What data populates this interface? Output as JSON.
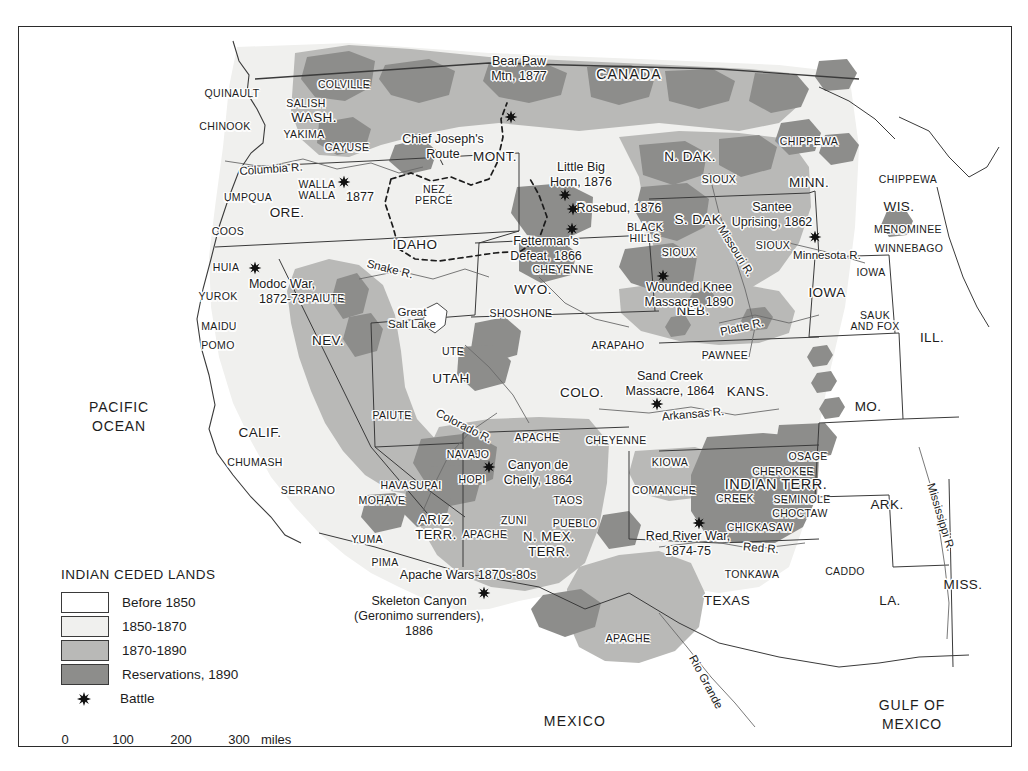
{
  "map": {
    "title_fragment": "",
    "countries": [
      {
        "name": "CANADA",
        "x": 610,
        "y": 48
      },
      {
        "name": "MEXICO",
        "x": 556,
        "y": 695
      }
    ],
    "oceans": [
      {
        "name": "PACIFIC\nOCEAN",
        "x": 100,
        "y": 390
      },
      {
        "name": "GULF OF\nMEXICO",
        "x": 893,
        "y": 688
      }
    ],
    "states": [
      {
        "name": "WASH.",
        "x": 295,
        "y": 91,
        "size": "lg"
      },
      {
        "name": "ORE.",
        "x": 268,
        "y": 186,
        "size": "lg"
      },
      {
        "name": "IDAHO",
        "x": 396,
        "y": 218,
        "size": "lg"
      },
      {
        "name": "MONT.",
        "x": 476,
        "y": 130,
        "size": "lg"
      },
      {
        "name": "N. DAK.",
        "x": 671,
        "y": 130,
        "size": "lg"
      },
      {
        "name": "S. DAK.",
        "x": 681,
        "y": 193,
        "size": "lg"
      },
      {
        "name": "MINN.",
        "x": 790,
        "y": 156,
        "size": "lg"
      },
      {
        "name": "WIS.",
        "x": 880,
        "y": 180,
        "size": "lg"
      },
      {
        "name": "IOWA",
        "x": 808,
        "y": 266,
        "size": "lg"
      },
      {
        "name": "ILL.",
        "x": 913,
        "y": 311,
        "size": "lg"
      },
      {
        "name": "MO.",
        "x": 849,
        "y": 380,
        "size": "lg"
      },
      {
        "name": "NEB.",
        "x": 674,
        "y": 284,
        "size": "lg"
      },
      {
        "name": "WYO.",
        "x": 514,
        "y": 263,
        "size": "lg"
      },
      {
        "name": "NEV.",
        "x": 309,
        "y": 314,
        "size": "lg"
      },
      {
        "name": "UTAH",
        "x": 432,
        "y": 352,
        "size": "lg"
      },
      {
        "name": "COLO.",
        "x": 563,
        "y": 366,
        "size": "lg"
      },
      {
        "name": "KANS.",
        "x": 729,
        "y": 365,
        "size": "lg"
      },
      {
        "name": "CALIF.",
        "x": 241,
        "y": 406,
        "size": "lg"
      },
      {
        "name": "ARK.",
        "x": 868,
        "y": 478,
        "size": "lg"
      },
      {
        "name": "MISS.",
        "x": 944,
        "y": 558,
        "size": "lg"
      },
      {
        "name": "LA.",
        "x": 871,
        "y": 574,
        "size": "lg"
      },
      {
        "name": "TEXAS",
        "x": 708,
        "y": 574,
        "size": "lg"
      }
    ],
    "territories": [
      {
        "name": "ARIZ.\nTERR.",
        "x": 417,
        "y": 501
      },
      {
        "name": "N. MEX.\nTERR.",
        "x": 530,
        "y": 518
      },
      {
        "name": "INDIAN TERR.",
        "x": 757,
        "y": 458
      }
    ],
    "tribes": [
      {
        "name": "QUINAULT",
        "x": 213,
        "y": 67
      },
      {
        "name": "CHINOOK",
        "x": 206,
        "y": 100
      },
      {
        "name": "SALISH",
        "x": 287,
        "y": 77
      },
      {
        "name": "YAKIMA",
        "x": 285,
        "y": 108
      },
      {
        "name": "COLVILLE",
        "x": 325,
        "y": 58
      },
      {
        "name": "CAYUSE",
        "x": 328,
        "y": 121
      },
      {
        "name": "WALLA\nWALLA",
        "x": 298,
        "y": 163
      },
      {
        "name": "UMPQUA",
        "x": 229,
        "y": 171
      },
      {
        "name": "COOS",
        "x": 209,
        "y": 205
      },
      {
        "name": "HUIA",
        "x": 207,
        "y": 241
      },
      {
        "name": "YUROK",
        "x": 199,
        "y": 270
      },
      {
        "name": "MAIDU",
        "x": 200,
        "y": 300
      },
      {
        "name": "POMO",
        "x": 199,
        "y": 319
      },
      {
        "name": "CHUMASH",
        "x": 236,
        "y": 436
      },
      {
        "name": "SERRANO",
        "x": 289,
        "y": 464
      },
      {
        "name": "NEZ\nPERCÉ",
        "x": 415,
        "y": 168
      },
      {
        "name": "PAIUTE",
        "x": 306,
        "y": 272
      },
      {
        "name": "PAIUTE",
        "x": 373,
        "y": 389
      },
      {
        "name": "SHOSHONE",
        "x": 502,
        "y": 287
      },
      {
        "name": "UTE",
        "x": 434,
        "y": 325
      },
      {
        "name": "SIOUX",
        "x": 700,
        "y": 153
      },
      {
        "name": "SIOUX",
        "x": 660,
        "y": 226
      },
      {
        "name": "SIOUX",
        "x": 754,
        "y": 219
      },
      {
        "name": "BLACK\nHILLS",
        "x": 626,
        "y": 206
      },
      {
        "name": "CHEYENNE",
        "x": 544,
        "y": 243
      },
      {
        "name": "CHEYENNE",
        "x": 597,
        "y": 414
      },
      {
        "name": "ARAPAHO",
        "x": 599,
        "y": 319
      },
      {
        "name": "PAWNEE",
        "x": 706,
        "y": 329
      },
      {
        "name": "CHIPPEWA",
        "x": 790,
        "y": 115
      },
      {
        "name": "CHIPPEWA",
        "x": 889,
        "y": 153
      },
      {
        "name": "MENOMINEE",
        "x": 889,
        "y": 203
      },
      {
        "name": "WINNEBAGO",
        "x": 890,
        "y": 222
      },
      {
        "name": "IOWA",
        "x": 852,
        "y": 246
      },
      {
        "name": "SAUK\nAND FOX",
        "x": 856,
        "y": 294
      },
      {
        "name": "KIOWA",
        "x": 651,
        "y": 436
      },
      {
        "name": "COMANCHE",
        "x": 645,
        "y": 464
      },
      {
        "name": "OSAGE",
        "x": 789,
        "y": 430
      },
      {
        "name": "CHEROKEE",
        "x": 764,
        "y": 445
      },
      {
        "name": "CREEK",
        "x": 716,
        "y": 472
      },
      {
        "name": "SEMINOLE",
        "x": 783,
        "y": 473
      },
      {
        "name": "CHOCTAW",
        "x": 781,
        "y": 487
      },
      {
        "name": "CHICKASAW",
        "x": 741,
        "y": 501
      },
      {
        "name": "CADDO",
        "x": 826,
        "y": 545
      },
      {
        "name": "TONKAWA",
        "x": 733,
        "y": 548
      },
      {
        "name": "NAVAJO",
        "x": 449,
        "y": 428
      },
      {
        "name": "HOPI",
        "x": 453,
        "y": 453
      },
      {
        "name": "HAVASUPAI",
        "x": 392,
        "y": 459
      },
      {
        "name": "MOHAVE",
        "x": 363,
        "y": 474
      },
      {
        "name": "YUMA",
        "x": 348,
        "y": 513
      },
      {
        "name": "PIMA",
        "x": 366,
        "y": 536
      },
      {
        "name": "APACHE",
        "x": 518,
        "y": 411
      },
      {
        "name": "APACHE",
        "x": 466,
        "y": 508
      },
      {
        "name": "ZUNI",
        "x": 495,
        "y": 494
      },
      {
        "name": "PUEBLO",
        "x": 556,
        "y": 497
      },
      {
        "name": "TAOS",
        "x": 549,
        "y": 474
      },
      {
        "name": "APACHE",
        "x": 609,
        "y": 612
      }
    ],
    "rivers": [
      {
        "name": "Columbia R.",
        "x": 252,
        "y": 142,
        "rot": -4
      },
      {
        "name": "Snake R.",
        "x": 371,
        "y": 242,
        "rot": 14
      },
      {
        "name": "Missouri R.",
        "x": 717,
        "y": 224,
        "rot": 58
      },
      {
        "name": "Minnesota R.",
        "x": 808,
        "y": 228,
        "rot": 0
      },
      {
        "name": "Platte R.",
        "x": 723,
        "y": 300,
        "rot": -13
      },
      {
        "name": "Arkansas R.",
        "x": 674,
        "y": 387,
        "rot": -5
      },
      {
        "name": "Colorado R.",
        "x": 445,
        "y": 399,
        "rot": 27
      },
      {
        "name": "Red R.",
        "x": 742,
        "y": 521,
        "rot": 5
      },
      {
        "name": "Rio Grande",
        "x": 687,
        "y": 655,
        "rot": 62
      },
      {
        "name": "Mississippi R.",
        "x": 922,
        "y": 490,
        "rot": 73
      },
      {
        "name": "Great\nSalt Lake",
        "x": 393,
        "y": 291,
        "rot": 0
      }
    ],
    "routes": [
      {
        "name": "Chief Joseph's\nRoute",
        "x": 424,
        "y": 120
      }
    ],
    "battles": [
      {
        "name": "Bear Paw\nMtn, 1877",
        "lx": 500,
        "ly": 42,
        "sx": 492,
        "sy": 90
      },
      {
        "name": "Little Big\nHorn, 1876",
        "lx": 562,
        "ly": 148,
        "sx": 546,
        "sy": 168
      },
      {
        "name": "Rosebud, 1876",
        "lx": 600,
        "ly": 181,
        "sx": 554,
        "sy": 182
      },
      {
        "name": "Fetterman's\nDefeat, 1866",
        "lx": 527,
        "ly": 222,
        "sx": 553,
        "sy": 202
      },
      {
        "name": "Wounded Knee\nMassacre, 1890",
        "lx": 670,
        "ly": 268,
        "sx": 644,
        "sy": 249
      },
      {
        "name": "Santee\nUprising, 1862",
        "lx": 753,
        "ly": 188,
        "sx": 796,
        "sy": 210
      },
      {
        "name": "Modoc War,\n1872-73",
        "lx": 263,
        "ly": 265,
        "sx": 236,
        "sy": 241
      },
      {
        "name": "Sand Creek\nMassacre, 1864",
        "lx": 651,
        "ly": 357,
        "sx": 638,
        "sy": 377
      },
      {
        "name": "Canyon de\nChelly, 1864",
        "lx": 519,
        "ly": 446,
        "sx": 470,
        "sy": 440
      },
      {
        "name": "Red River War,\n1874-75",
        "lx": 669,
        "ly": 517,
        "sx": 680,
        "sy": 496
      },
      {
        "name": "Apache Wars 1870s-80s",
        "lx": 449,
        "ly": 548,
        "sx": -100,
        "sy": -100
      },
      {
        "name": "Skeleton Canyon\n(Geronimo surrenders),\n1886",
        "lx": 400,
        "ly": 589,
        "sx": 465,
        "sy": 566
      },
      {
        "name": "1877",
        "lx": 341,
        "ly": 170,
        "sx": 325,
        "sy": 155
      }
    ],
    "legend": {
      "title": "INDIAN CEDED LANDS",
      "items": [
        {
          "label": "Before 1850",
          "color": "#ffffff",
          "type": "swatch"
        },
        {
          "label": "1850-1870",
          "color": "#f0f0ee",
          "type": "swatch"
        },
        {
          "label": "1870-1890",
          "color": "#b9b9b7",
          "type": "swatch"
        },
        {
          "label": "Reservations, 1890",
          "color": "#8d8d8b",
          "type": "swatch"
        },
        {
          "label": "Battle",
          "color": "#111111",
          "type": "star"
        }
      ]
    },
    "scale": {
      "ticks": [
        "0",
        "100",
        "200",
        "300"
      ],
      "unit": "miles"
    },
    "colors": {
      "before_1850": "#ffffff",
      "ceded_1850_1870": "#f0f0ee",
      "ceded_1870_1890": "#b9b9b7",
      "reservations_1890": "#8d8d8b",
      "outline": "#2b2b2b",
      "text": "#1c1c1c"
    }
  }
}
